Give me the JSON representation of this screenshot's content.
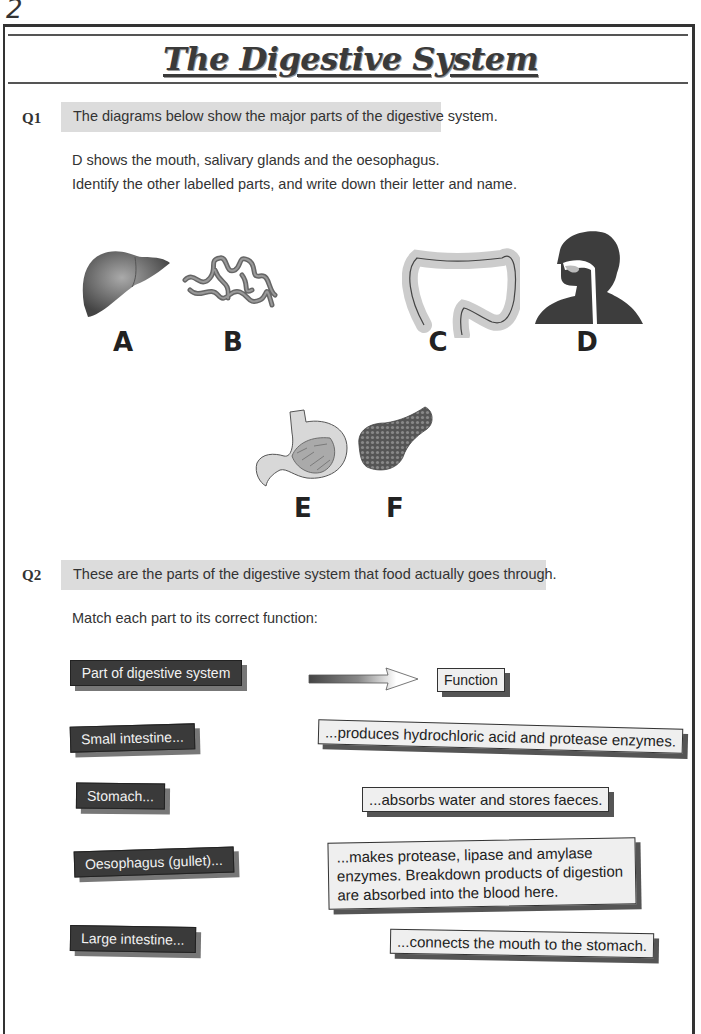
{
  "page": {
    "number": "2",
    "title": "The Digestive System"
  },
  "q1": {
    "label": "Q1",
    "prompt": "The diagrams below show the major parts of the digestive system.",
    "line1": "D shows the mouth, salivary glands and the oesophagus.",
    "line2": "Identify the other labelled parts, and write down their letter and name.",
    "figures": [
      {
        "letter": "A",
        "icon": "liver-icon"
      },
      {
        "letter": "B",
        "icon": "small-intestine-icon"
      },
      {
        "letter": "C",
        "icon": "large-intestine-icon"
      },
      {
        "letter": "D",
        "icon": "head-mouth-oesophagus-icon"
      },
      {
        "letter": "E",
        "icon": "stomach-icon"
      },
      {
        "letter": "F",
        "icon": "pancreas-icon"
      }
    ]
  },
  "q2": {
    "label": "Q2",
    "prompt": "These are the parts of the digestive system that food actually goes through.",
    "instruction": "Match each part to its correct function:",
    "header_part": "Part of digestive system",
    "header_function": "Function",
    "parts": [
      "Small intestine...",
      "Stomach...",
      "Oesophagus (gullet)...",
      "Large intestine..."
    ],
    "functions": [
      "...produces hydrochloric acid and protease enzymes.",
      "...absorbs water and stores faeces.",
      "...makes protease, lipase and amylase enzymes.  Breakdown products of digestion are absorbed into the blood here.",
      "...connects the mouth to the stomach."
    ]
  },
  "colors": {
    "dark_label": "#3a3a3a",
    "light_label": "#efefef",
    "question_bar": "#dcdcdc"
  }
}
